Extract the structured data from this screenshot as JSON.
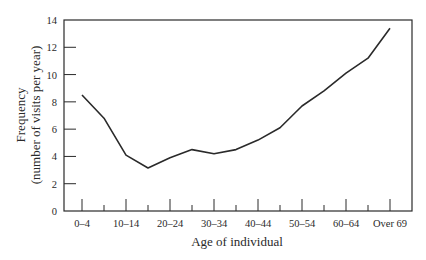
{
  "chart_data": {
    "type": "line",
    "title": "",
    "xlabel": "Age of individual",
    "ylabel": [
      "Frequency",
      "(number of visits per year)"
    ],
    "ylim": [
      0,
      14
    ],
    "yticks": [
      0,
      2,
      4,
      6,
      8,
      10,
      12,
      14
    ],
    "grid": false,
    "legend": null,
    "categories": [
      "0–4",
      "5–9",
      "10–14",
      "15–19",
      "20–24",
      "25–29",
      "30–34",
      "35–39",
      "40–44",
      "45–49",
      "50–54",
      "55–59",
      "60–64",
      "65–69",
      "Over 69"
    ],
    "labeled_categories": [
      "0–4",
      "10–14",
      "20–24",
      "30–34",
      "40–44",
      "50–54",
      "60–64",
      "Over 69"
    ],
    "series": [
      {
        "name": "Frequency",
        "values": [
          8.5,
          6.8,
          4.1,
          3.15,
          3.9,
          4.5,
          4.2,
          4.5,
          5.2,
          6.1,
          7.7,
          8.8,
          10.1,
          11.2,
          13.4
        ]
      }
    ],
    "colors": {
      "line": "#2a2a2a",
      "axis": "#2a2a2a",
      "background": "#ffffff"
    }
  }
}
